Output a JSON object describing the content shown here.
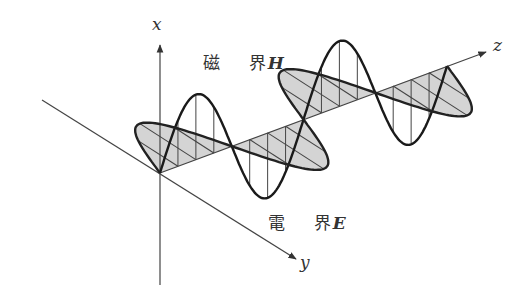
{
  "figure": {
    "title": "",
    "axes": {
      "x_label": "x",
      "y_label": "y",
      "z_label": "z"
    },
    "labels": {
      "magnetic_field": {
        "chars": [
          "磁",
          "界"
        ],
        "symbol": "H"
      },
      "electric_field": {
        "chars": [
          "電",
          "界"
        ],
        "symbol": "E"
      }
    },
    "colors": {
      "line": "#222222",
      "axis": "#444444",
      "shade": "#d4d4d4",
      "hatch": "#444444"
    }
  },
  "chart_data": {
    "type": "diagram",
    "origin": [
      160,
      173
    ],
    "z_end": [
      447,
      66
    ],
    "z_arrow_tip": [
      486,
      52
    ],
    "y_axis_start": [
      42,
      100
    ],
    "y_arrow_tip": [
      296,
      259
    ],
    "x_axis_bottom": [
      160,
      285
    ],
    "x_arrow_tip": [
      160,
      45
    ],
    "wavelengths": 2,
    "vertical_wave_amplitude": 65,
    "horizontal_wave_offset": [
      56,
      36
    ],
    "series": [
      {
        "name": "磁界H (vertical, hatched with vertical lines)",
        "plane": "x-z"
      },
      {
        "name": "電界E (shaded, hatched with slanted lines)",
        "plane": "y-z"
      }
    ]
  }
}
